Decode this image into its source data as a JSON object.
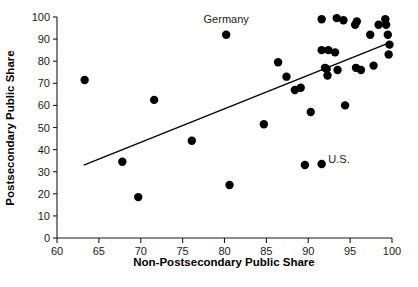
{
  "chart_data": {
    "type": "scatter",
    "title": "",
    "subtitle": "",
    "xlabel": "Non-Postsecondary Public Share",
    "ylabel": "Postsecondary Public Share",
    "xlim": [
      60,
      100
    ],
    "ylim": [
      0,
      100
    ],
    "xticks": [
      60,
      65,
      70,
      75,
      80,
      85,
      90,
      95,
      100
    ],
    "xtick_labels": [
      "60",
      "65",
      "70",
      "75",
      "80",
      "85",
      "90",
      "95",
      "100"
    ],
    "yticks": [
      0,
      10,
      20,
      30,
      40,
      50,
      60,
      70,
      80,
      90,
      100
    ],
    "ytick_labels": [
      "0",
      "10",
      "20",
      "30",
      "40",
      "50",
      "60",
      "70",
      "80",
      "90",
      "100"
    ],
    "grid": false,
    "legend": false,
    "legend_position": "none",
    "marker_color": "#000000",
    "marker_size": 4.2,
    "points": [
      {
        "x": 63.3,
        "y": 71.5,
        "label": ""
      },
      {
        "x": 67.8,
        "y": 34.5,
        "label": ""
      },
      {
        "x": 69.7,
        "y": 18.5,
        "label": ""
      },
      {
        "x": 71.6,
        "y": 62.5,
        "label": ""
      },
      {
        "x": 76.1,
        "y": 44.0,
        "label": ""
      },
      {
        "x": 80.2,
        "y": 92.0,
        "label": "Germany"
      },
      {
        "x": 80.6,
        "y": 24.0,
        "label": ""
      },
      {
        "x": 84.7,
        "y": 51.5,
        "label": ""
      },
      {
        "x": 86.4,
        "y": 79.5,
        "label": ""
      },
      {
        "x": 87.4,
        "y": 73.0,
        "label": ""
      },
      {
        "x": 88.4,
        "y": 67.0,
        "label": ""
      },
      {
        "x": 89.1,
        "y": 68.0,
        "label": ""
      },
      {
        "x": 89.6,
        "y": 33.0,
        "label": ""
      },
      {
        "x": 90.3,
        "y": 57.0,
        "label": ""
      },
      {
        "x": 91.6,
        "y": 33.5,
        "label": "U.S."
      },
      {
        "x": 91.6,
        "y": 99.0,
        "label": ""
      },
      {
        "x": 91.6,
        "y": 85.0,
        "label": ""
      },
      {
        "x": 92.0,
        "y": 77.0,
        "label": ""
      },
      {
        "x": 92.2,
        "y": 76.5,
        "label": ""
      },
      {
        "x": 92.3,
        "y": 73.5,
        "label": ""
      },
      {
        "x": 92.4,
        "y": 85.0,
        "label": ""
      },
      {
        "x": 93.4,
        "y": 99.5,
        "label": ""
      },
      {
        "x": 93.2,
        "y": 84.0,
        "label": ""
      },
      {
        "x": 93.5,
        "y": 76.0,
        "label": ""
      },
      {
        "x": 94.2,
        "y": 98.5,
        "label": ""
      },
      {
        "x": 94.4,
        "y": 60.0,
        "label": ""
      },
      {
        "x": 95.6,
        "y": 96.5,
        "label": ""
      },
      {
        "x": 95.7,
        "y": 77.0,
        "label": ""
      },
      {
        "x": 95.8,
        "y": 98.0,
        "label": ""
      },
      {
        "x": 96.3,
        "y": 76.0,
        "label": ""
      },
      {
        "x": 97.4,
        "y": 92.0,
        "label": ""
      },
      {
        "x": 97.8,
        "y": 78.0,
        "label": ""
      },
      {
        "x": 98.4,
        "y": 96.5,
        "label": ""
      },
      {
        "x": 99.2,
        "y": 99.0,
        "label": ""
      },
      {
        "x": 99.3,
        "y": 96.5,
        "label": ""
      },
      {
        "x": 99.5,
        "y": 92.0,
        "label": ""
      },
      {
        "x": 99.6,
        "y": 83.0,
        "label": ""
      },
      {
        "x": 99.7,
        "y": 87.5,
        "label": ""
      }
    ],
    "trend_line": {
      "x_start": 63.2,
      "y_start": 33.0,
      "x_end": 99.8,
      "y_end": 88.5,
      "color": "#000000"
    },
    "annotations": [
      {
        "text": "Germany",
        "x": 80.2,
        "y": 97.5
      },
      {
        "text": "U.S.",
        "x": 92.4,
        "y": 34.0
      }
    ]
  }
}
